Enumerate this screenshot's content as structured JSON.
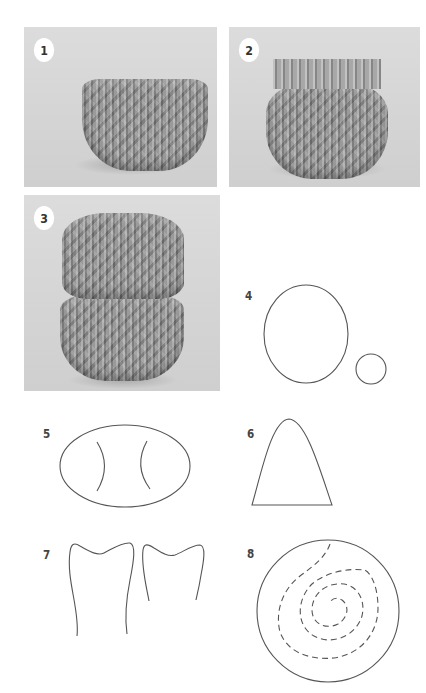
{
  "steps": [
    {
      "number": "1",
      "type": "photo",
      "description": "Origami vase base with flared folded top"
    },
    {
      "number": "2",
      "type": "photo",
      "description": "Origami vase with upright fringe collar"
    },
    {
      "number": "3",
      "type": "photo",
      "description": "Two stacked origami vase sections"
    },
    {
      "number": "4",
      "type": "diagram",
      "description": "Large oval and small circle"
    },
    {
      "number": "5",
      "type": "diagram",
      "description": "Horizontal oval with two inner curved lines"
    },
    {
      "number": "6",
      "type": "diagram",
      "description": "Rounded cone / arch shape"
    },
    {
      "number": "7",
      "type": "diagram",
      "description": "Two molar-tooth shaped outlines"
    },
    {
      "number": "8",
      "type": "diagram",
      "description": "Circle with dashed spiral inside"
    }
  ],
  "colors": {
    "line": "#555555",
    "photo_bg": "#d6d6d6",
    "paper": "#9a9a9a"
  }
}
